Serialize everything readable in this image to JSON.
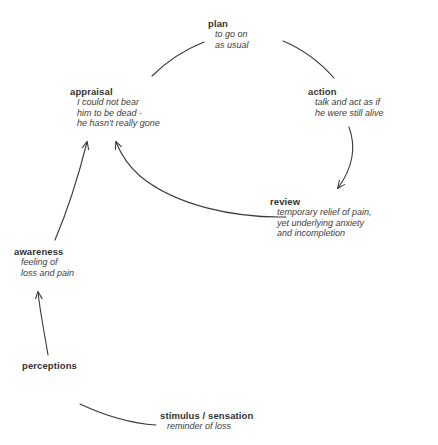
{
  "diagram": {
    "background_color": "#ffffff",
    "line_color": "#3a3a3a",
    "text_color": "#333333",
    "nodes": [
      {
        "id": "plan",
        "title": "plan",
        "lines": [
          "to go on",
          "as usual"
        ]
      },
      {
        "id": "appraisal",
        "title": "appraisal",
        "lines": [
          "I could not bear",
          "him to be dead -",
          "he hasn't really gone"
        ]
      },
      {
        "id": "action",
        "title": "action",
        "lines": [
          "talk and act as if",
          "he were still alive"
        ]
      },
      {
        "id": "review",
        "title": "review",
        "lines": [
          "temporary relief of pain,",
          "yet underlying anxiety",
          "and incompletion"
        ]
      },
      {
        "id": "awareness",
        "title": "awareness",
        "lines": [
          "feeling of",
          "loss and pain"
        ]
      },
      {
        "id": "perceptions",
        "title": "perceptions",
        "lines": []
      },
      {
        "id": "stimulus",
        "title": "stimulus / sensation",
        "lines": [
          "reminder of loss"
        ]
      }
    ]
  }
}
